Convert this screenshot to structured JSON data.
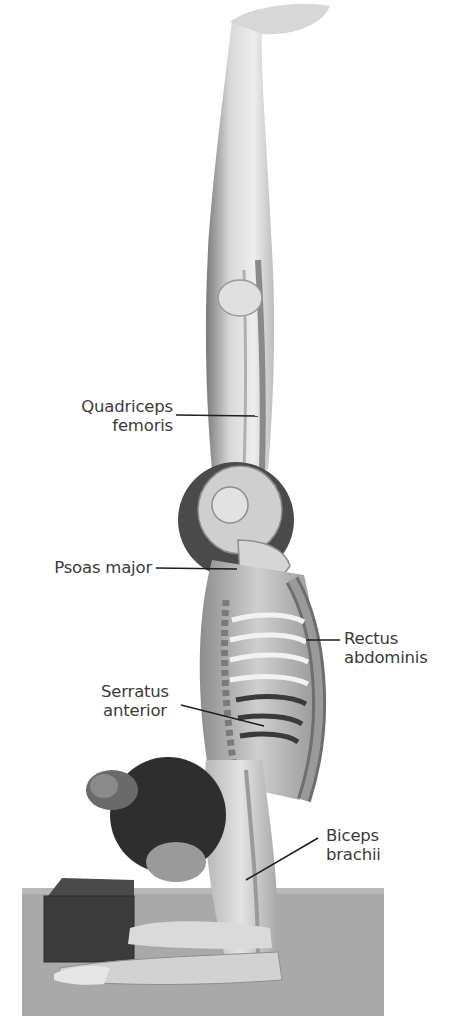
{
  "figure": {
    "colors": {
      "background": "#ffffff",
      "mat": "#a9a9a9",
      "block": "#3b3b3b",
      "hair": "#2e2e2e",
      "label_text": "#3a3a3a",
      "leader_line": "#1e1e1e"
    }
  },
  "labels": [
    {
      "id": "quadriceps-femoris",
      "lines": [
        "Quadriceps",
        "femoris"
      ]
    },
    {
      "id": "psoas-major",
      "lines": [
        "Psoas major"
      ]
    },
    {
      "id": "rectus-abdominis",
      "lines": [
        "Rectus",
        "abdominis"
      ]
    },
    {
      "id": "serratus-anterior",
      "lines": [
        "Serratus",
        "anterior"
      ]
    },
    {
      "id": "biceps-brachii",
      "lines": [
        "Biceps",
        "brachii"
      ]
    }
  ]
}
